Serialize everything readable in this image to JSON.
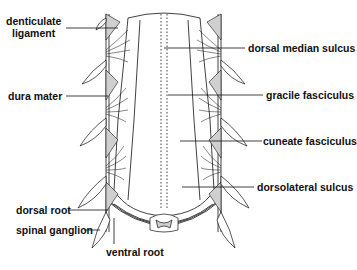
{
  "figure": {
    "colors": {
      "ink": "#111111",
      "shade": "#cfcfcf",
      "background": "#ffffff"
    }
  },
  "labels": {
    "left": [
      {
        "id": "denticulate",
        "line1": "denticulate",
        "line2": "ligament"
      },
      {
        "id": "dura",
        "text": "dura mater"
      },
      {
        "id": "dorsal_root",
        "text": "dorsal root"
      },
      {
        "id": "spinal_ganglion",
        "text": "spinal ganglion"
      }
    ],
    "bottom": [
      {
        "id": "ventral_root",
        "text": "ventral root"
      }
    ],
    "right": [
      {
        "id": "dorsal_median_sulcus",
        "text": "dorsal median sulcus"
      },
      {
        "id": "gracile",
        "text": "gracile fasciculus"
      },
      {
        "id": "cuneate",
        "text": "cuneate fasciculus"
      },
      {
        "id": "dorsolateral",
        "text": "dorsolateral sulcus"
      }
    ]
  }
}
